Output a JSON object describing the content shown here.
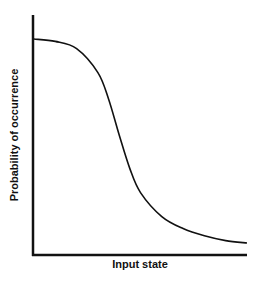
{
  "chart_data": {
    "type": "line",
    "title": "",
    "xlabel": "Input state",
    "ylabel": "Probability of occurrence",
    "grid": false,
    "legend": null,
    "x": [
      0,
      0.1,
      0.2,
      0.3,
      0.35,
      0.4,
      0.45,
      0.5,
      0.6,
      0.7,
      0.8,
      0.9,
      1.0
    ],
    "series": [
      {
        "name": "probability",
        "values": [
          0.9,
          0.89,
          0.86,
          0.76,
          0.65,
          0.5,
          0.36,
          0.26,
          0.16,
          0.11,
          0.08,
          0.06,
          0.05
        ]
      }
    ],
    "xlim": [
      0,
      1
    ],
    "ylim": [
      0,
      1
    ],
    "ticks": "none",
    "line_color": "#111111"
  }
}
